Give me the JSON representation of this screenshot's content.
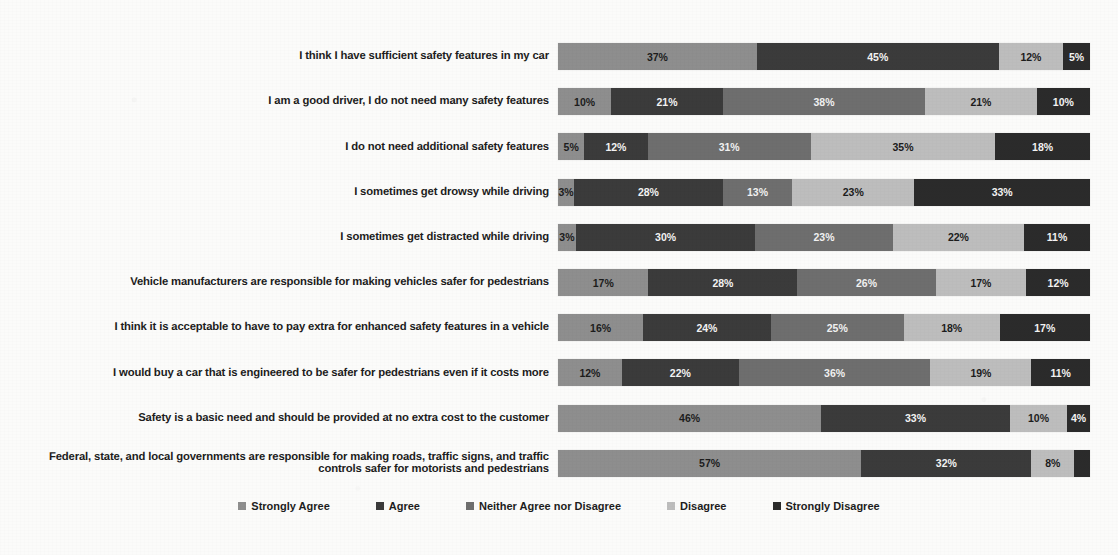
{
  "chart_data": {
    "type": "bar",
    "subtype": "horizontal-stacked-100",
    "title": "",
    "xlabel": "",
    "ylabel": "",
    "xlim": [
      0,
      100
    ],
    "grid": false,
    "legend_position": "bottom",
    "value_suffix": "%",
    "categories": [
      "I think I have sufficient safety features in my car",
      "I am a good driver, I do not need many safety features",
      "I do not need additional safety features",
      "I sometimes get drowsy while driving",
      "I sometimes get distracted while driving",
      "Vehicle manufacturers are responsible for making vehicles safer for pedestrians",
      "I think it is acceptable to have to pay extra for enhanced safety features in a vehicle",
      "I would buy a car that is engineered to be safer for pedestrians even if it costs more",
      "Safety is a basic need and should be provided at no extra cost to the customer",
      "Federal, state, and local governments are responsible for making roads, traffic signs, and traffic controls safer for motorists and pedestrians"
    ],
    "series": [
      {
        "name": "Strongly Agree",
        "color": "#8e8e8e",
        "values": [
          37,
          10,
          5,
          3,
          3,
          17,
          16,
          12,
          46,
          57
        ]
      },
      {
        "name": "Agree",
        "color": "#3b3b3b",
        "values": [
          45,
          21,
          12,
          28,
          30,
          28,
          24,
          22,
          33,
          32
        ]
      },
      {
        "name": "Neither Agree nor Disagree",
        "color": "#6e6e6e",
        "values": [
          0,
          38,
          31,
          13,
          23,
          26,
          25,
          36,
          0,
          0
        ]
      },
      {
        "name": "Disagree",
        "color": "#bdbdbd",
        "values": [
          12,
          21,
          35,
          23,
          22,
          17,
          18,
          19,
          10,
          8
        ]
      },
      {
        "name": "Strongly Disagree",
        "color": "#2b2b2b",
        "values": [
          5,
          10,
          18,
          33,
          11,
          12,
          17,
          11,
          4,
          3
        ]
      }
    ],
    "bars": [
      {
        "category_index": 0,
        "segments": [
          {
            "series": "Strongly Agree",
            "value": 37,
            "label": "37%",
            "show_label": true
          },
          {
            "series": "Agree",
            "value": 45,
            "label": "45%",
            "show_label": true
          },
          {
            "series": "Neither Agree nor Disagree",
            "value": 0,
            "label": "",
            "show_label": false
          },
          {
            "series": "Disagree",
            "value": 12,
            "label": "12%",
            "show_label": true
          },
          {
            "series": "Strongly Disagree",
            "value": 5,
            "label": "5%",
            "show_label": true
          }
        ]
      },
      {
        "category_index": 1,
        "segments": [
          {
            "series": "Strongly Agree",
            "value": 10,
            "label": "10%",
            "show_label": true
          },
          {
            "series": "Agree",
            "value": 21,
            "label": "21%",
            "show_label": true
          },
          {
            "series": "Neither Agree nor Disagree",
            "value": 38,
            "label": "38%",
            "show_label": true
          },
          {
            "series": "Disagree",
            "value": 21,
            "label": "21%",
            "show_label": true
          },
          {
            "series": "Strongly Disagree",
            "value": 10,
            "label": "10%",
            "show_label": true
          }
        ]
      },
      {
        "category_index": 2,
        "segments": [
          {
            "series": "Strongly Agree",
            "value": 5,
            "label": "5%",
            "show_label": true
          },
          {
            "series": "Agree",
            "value": 12,
            "label": "12%",
            "show_label": true
          },
          {
            "series": "Neither Agree nor Disagree",
            "value": 31,
            "label": "31%",
            "show_label": true
          },
          {
            "series": "Disagree",
            "value": 35,
            "label": "35%",
            "show_label": true
          },
          {
            "series": "Strongly Disagree",
            "value": 18,
            "label": "18%",
            "show_label": true
          }
        ]
      },
      {
        "category_index": 3,
        "segments": [
          {
            "series": "Strongly Agree",
            "value": 3,
            "label": "3%",
            "show_label": true
          },
          {
            "series": "Agree",
            "value": 28,
            "label": "28%",
            "show_label": true
          },
          {
            "series": "Neither Agree nor Disagree",
            "value": 13,
            "label": "13%",
            "show_label": true
          },
          {
            "series": "Disagree",
            "value": 23,
            "label": "23%",
            "show_label": true
          },
          {
            "series": "Strongly Disagree",
            "value": 33,
            "label": "33%",
            "show_label": true
          }
        ]
      },
      {
        "category_index": 4,
        "segments": [
          {
            "series": "Strongly Agree",
            "value": 3,
            "label": "3%",
            "show_label": true
          },
          {
            "series": "Agree",
            "value": 30,
            "label": "30%",
            "show_label": true
          },
          {
            "series": "Neither Agree nor Disagree",
            "value": 23,
            "label": "23%",
            "show_label": true
          },
          {
            "series": "Disagree",
            "value": 22,
            "label": "22%",
            "show_label": true
          },
          {
            "series": "Strongly Disagree",
            "value": 11,
            "label": "11%",
            "show_label": true
          }
        ]
      },
      {
        "category_index": 5,
        "segments": [
          {
            "series": "Strongly Agree",
            "value": 17,
            "label": "17%",
            "show_label": true
          },
          {
            "series": "Agree",
            "value": 28,
            "label": "28%",
            "show_label": true
          },
          {
            "series": "Neither Agree nor Disagree",
            "value": 26,
            "label": "26%",
            "show_label": true
          },
          {
            "series": "Disagree",
            "value": 17,
            "label": "17%",
            "show_label": true
          },
          {
            "series": "Strongly Disagree",
            "value": 12,
            "label": "12%",
            "show_label": true
          }
        ]
      },
      {
        "category_index": 6,
        "segments": [
          {
            "series": "Strongly Agree",
            "value": 16,
            "label": "16%",
            "show_label": true
          },
          {
            "series": "Agree",
            "value": 24,
            "label": "24%",
            "show_label": true
          },
          {
            "series": "Neither Agree nor Disagree",
            "value": 25,
            "label": "25%",
            "show_label": true
          },
          {
            "series": "Disagree",
            "value": 18,
            "label": "18%",
            "show_label": true
          },
          {
            "series": "Strongly Disagree",
            "value": 17,
            "label": "17%",
            "show_label": true
          }
        ]
      },
      {
        "category_index": 7,
        "segments": [
          {
            "series": "Strongly Agree",
            "value": 12,
            "label": "12%",
            "show_label": true
          },
          {
            "series": "Agree",
            "value": 22,
            "label": "22%",
            "show_label": true
          },
          {
            "series": "Neither Agree nor Disagree",
            "value": 36,
            "label": "36%",
            "show_label": true
          },
          {
            "series": "Disagree",
            "value": 19,
            "label": "19%",
            "show_label": true
          },
          {
            "series": "Strongly Disagree",
            "value": 11,
            "label": "11%",
            "show_label": true
          }
        ]
      },
      {
        "category_index": 8,
        "segments": [
          {
            "series": "Strongly Agree",
            "value": 46,
            "label": "46%",
            "show_label": true
          },
          {
            "series": "Agree",
            "value": 33,
            "label": "33%",
            "show_label": true
          },
          {
            "series": "Neither Agree nor Disagree",
            "value": 0,
            "label": "",
            "show_label": false
          },
          {
            "series": "Disagree",
            "value": 10,
            "label": "10%",
            "show_label": true
          },
          {
            "series": "Strongly Disagree",
            "value": 4,
            "label": "4%",
            "show_label": true
          }
        ]
      },
      {
        "category_index": 9,
        "segments": [
          {
            "series": "Strongly Agree",
            "value": 57,
            "label": "57%",
            "show_label": true
          },
          {
            "series": "Agree",
            "value": 32,
            "label": "32%",
            "show_label": true
          },
          {
            "series": "Neither Agree nor Disagree",
            "value": 0,
            "label": "",
            "show_label": false
          },
          {
            "series": "Disagree",
            "value": 8,
            "label": "8%",
            "show_label": true
          },
          {
            "series": "Strongly Disagree",
            "value": 3,
            "label": "",
            "show_label": false
          }
        ]
      }
    ],
    "legend": [
      {
        "label": "Strongly Agree",
        "color": "#8e8e8e"
      },
      {
        "label": "Agree",
        "color": "#3b3b3b"
      },
      {
        "label": "Neither Agree nor Disagree",
        "color": "#6e6e6e"
      },
      {
        "label": "Disagree",
        "color": "#bdbdbd"
      },
      {
        "label": "Strongly Disagree",
        "color": "#2b2b2b"
      }
    ]
  }
}
